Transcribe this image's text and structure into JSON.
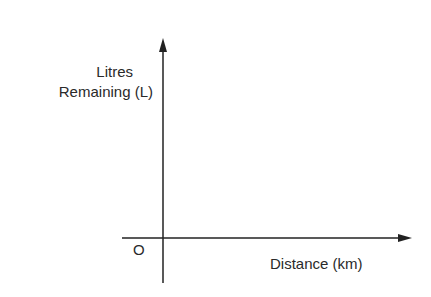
{
  "diagram": {
    "type": "axes-sketch",
    "y_axis": {
      "label_line1": "Litres",
      "label_line2": "Remaining (L)"
    },
    "x_axis": {
      "label": "Distance (km)"
    },
    "origin_label": "O",
    "colors": {
      "axis": "#222222",
      "text": "#2a2a2a",
      "background": "#ffffff"
    }
  }
}
